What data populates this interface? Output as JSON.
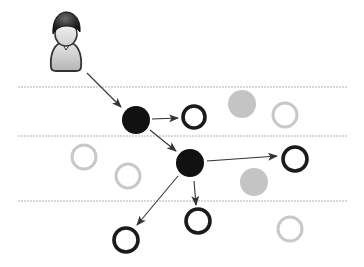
{
  "diagram": {
    "title": "Information cascade from user through network nodes",
    "colors": {
      "background": "#ffffff",
      "active_fill": "#111111",
      "active_ring": "#1a1a1a",
      "inactive_fill": "#c4c4c4",
      "inactive_ring": "#c8c8c8",
      "divider": "#b0b0b0",
      "edge": "#333333"
    },
    "dividers": [
      {
        "y": 87,
        "x1": 18,
        "x2": 348
      },
      {
        "y": 136,
        "x1": 18,
        "x2": 348
      },
      {
        "y": 201,
        "x1": 18,
        "x2": 348
      }
    ],
    "user": {
      "label": "user",
      "icon": "person-icon",
      "cx": 66,
      "cy": 40
    },
    "nodes": [
      {
        "id": "A",
        "type": "active-filled",
        "cx": 136,
        "cy": 120,
        "r": 14
      },
      {
        "id": "B",
        "type": "active-ring",
        "cx": 194,
        "cy": 117,
        "r": 13
      },
      {
        "id": "C",
        "type": "inactive-filled",
        "cx": 242,
        "cy": 104,
        "r": 14
      },
      {
        "id": "D",
        "type": "inactive-ring",
        "cx": 285,
        "cy": 115,
        "r": 14
      },
      {
        "id": "E",
        "type": "inactive-ring",
        "cx": 84,
        "cy": 157,
        "r": 14
      },
      {
        "id": "F",
        "type": "inactive-ring",
        "cx": 128,
        "cy": 176,
        "r": 14
      },
      {
        "id": "G",
        "type": "active-filled",
        "cx": 190,
        "cy": 163,
        "r": 14
      },
      {
        "id": "H",
        "type": "active-ring",
        "cx": 295,
        "cy": 159,
        "r": 14
      },
      {
        "id": "I",
        "type": "inactive-filled",
        "cx": 254,
        "cy": 182,
        "r": 14
      },
      {
        "id": "J",
        "type": "active-ring",
        "cx": 198,
        "cy": 221,
        "r": 14
      },
      {
        "id": "K",
        "type": "inactive-ring",
        "cx": 290,
        "cy": 229,
        "r": 14
      },
      {
        "id": "L",
        "type": "active-ring",
        "cx": 126,
        "cy": 240,
        "r": 14
      }
    ],
    "edges": [
      {
        "from": "user",
        "to": "A",
        "x1": 87,
        "y1": 73,
        "x2": 121,
        "y2": 107
      },
      {
        "from": "A",
        "to": "B",
        "x1": 152,
        "y1": 119,
        "x2": 178,
        "y2": 118
      },
      {
        "from": "A",
        "to": "G",
        "x1": 150,
        "y1": 130,
        "x2": 176,
        "y2": 151
      },
      {
        "from": "G",
        "to": "H",
        "x1": 207,
        "y1": 161,
        "x2": 277,
        "y2": 156
      },
      {
        "from": "G",
        "to": "J",
        "x1": 194,
        "y1": 181,
        "x2": 196,
        "y2": 205
      },
      {
        "from": "G",
        "to": "L",
        "x1": 178,
        "y1": 176,
        "x2": 137,
        "y2": 225
      }
    ]
  }
}
